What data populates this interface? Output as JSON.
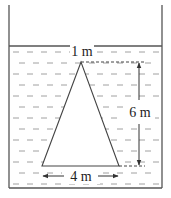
{
  "diagram": {
    "labels": {
      "top_width": "1 m",
      "height": "6 m",
      "base_width": "4 m"
    },
    "colors": {
      "stroke": "#444444",
      "water_dash": "#9a9a9a",
      "background": "#ffffff"
    }
  }
}
